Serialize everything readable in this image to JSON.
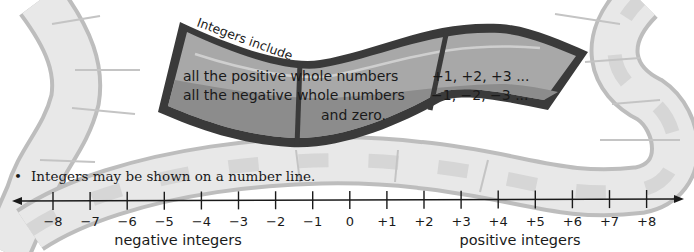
{
  "banner": {
    "title": "Integers include",
    "rows": [
      {
        "description": "all the positive whole numbers",
        "examples": "+1, +2, +3 ..."
      },
      {
        "description": "all the negative whole numbers",
        "examples": "−1, −2, −3 ..."
      },
      {
        "description": "and zero.",
        "examples": ""
      }
    ]
  },
  "bullet": {
    "marker": "•",
    "text": "Integers may be shown on a number line."
  },
  "number_line": {
    "ticks": [
      "−8",
      "−7",
      "−6",
      "−5",
      "−4",
      "−3",
      "−2",
      "−1",
      "0",
      "+1",
      "+2",
      "+3",
      "+4",
      "+5",
      "+6",
      "+7",
      "+8"
    ],
    "negative_label": "negative integers",
    "positive_label": "positive integers"
  },
  "colors": {
    "road_fill": "#e6e6e6",
    "road_edge": "#bdbdbd",
    "banner_frame": "#3a3a3a",
    "banner_top": "#a8a8a8",
    "banner_bottom": "#8c8c8c",
    "text": "#1a1a1a"
  }
}
